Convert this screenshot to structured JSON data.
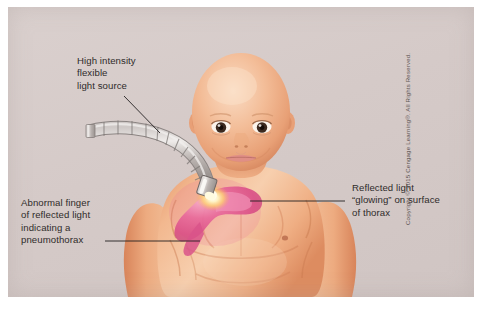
{
  "figure": {
    "background_color": "#d5cac8",
    "outer_margin_color": "#ffffff"
  },
  "callouts": [
    {
      "id": "light-source",
      "text": "High intensity\nflexible\nlight source",
      "leader": "diagonal-down-right"
    },
    {
      "id": "abnormal-finger",
      "text": "Abnormal finger\nof reflected light\nindicating a\npneumothorax",
      "leader": "horizontal-right"
    },
    {
      "id": "reflected-light",
      "text": "Reflected light\n“glowing” on surface\nof thorax",
      "leader": "horizontal-left"
    }
  ],
  "copyright": {
    "text": "Copyright © 2015 Cengage Learning®. All Rights Reserved."
  },
  "illustration": {
    "subject": "newborn-infant-torso-and-head",
    "skin_color": "#eeab84",
    "skin_highlight": "#f6cdb0",
    "skin_shadow": "#d98a63",
    "glow_color": "#e0558c",
    "glow_hotspot": "#fff3b0",
    "probe_color": "#b5aeac",
    "probe_highlight": "#e8e4e2",
    "leader_line_color": "#231f20"
  }
}
